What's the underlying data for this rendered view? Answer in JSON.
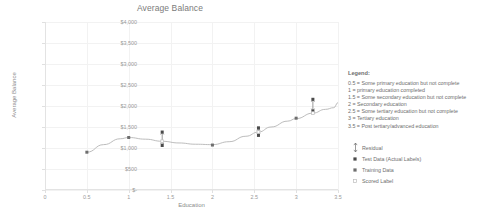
{
  "chart_data": {
    "type": "scatter",
    "title": "Average Balance",
    "xlabel": "Education",
    "ylabel": "Average Balance",
    "xlim": [
      0,
      3.5
    ],
    "ylim": [
      0,
      4000
    ],
    "grid": true,
    "legend_position": "right",
    "x_ticks": [
      "0",
      "0.5",
      "1",
      "1.5",
      "2",
      "2.5",
      "3",
      "3.5"
    ],
    "x_tick_values": [
      0,
      0.5,
      1,
      1.5,
      2,
      2.5,
      3,
      3.5
    ],
    "y_ticks": [
      "$-",
      "$500",
      "$1,000",
      "$1,500",
      "$2,000",
      "$2,500",
      "$3,000",
      "$3,500",
      "$4,000"
    ],
    "y_tick_values": [
      0,
      500,
      1000,
      1500,
      2000,
      2500,
      3000,
      3500,
      4000
    ],
    "series": [
      {
        "name": "Scored Label",
        "type": "line",
        "x": [
          0.5,
          0.7,
          0.9,
          1.0,
          1.2,
          1.4,
          1.6,
          1.8,
          2.0,
          2.2,
          2.4,
          2.55,
          2.7,
          2.9,
          3.0,
          3.2,
          3.35,
          3.45,
          3.5
        ],
        "values": [
          900,
          1080,
          1220,
          1250,
          1210,
          1160,
          1120,
          1090,
          1080,
          1150,
          1280,
          1380,
          1500,
          1640,
          1700,
          1830,
          1920,
          1960,
          2080
        ]
      },
      {
        "name": "Training Data",
        "type": "scatter",
        "x": [
          0.5,
          1.0,
          2.0,
          3.0
        ],
        "values": [
          900,
          1250,
          1070,
          1710
        ]
      },
      {
        "name": "Test Data (Actual Labels)",
        "type": "scatter",
        "x": [
          1.4,
          1.4,
          2.55,
          2.55,
          3.2,
          3.2
        ],
        "values": [
          1380,
          1060,
          1480,
          1300,
          2160,
          1880
        ]
      },
      {
        "name": "Residual",
        "type": "errorbar",
        "x": [
          1.4,
          2.55,
          3.2
        ],
        "y_low": [
          1060,
          1300,
          1880
        ],
        "y_high": [
          1380,
          1480,
          2160
        ]
      }
    ],
    "annotations": []
  },
  "legend": {
    "heading": "Legend:",
    "education_codes": [
      "0.5 = Some primary education but not complete",
      "1 = primary education completed",
      "1.5 = Some secondary education but not complete",
      "2 = Secondary education",
      "2.5 = Some tertiary education but not complete",
      "3 = Tertiary education",
      "3.5 = Post tertiary/advanced education"
    ],
    "keys": [
      {
        "label": "Residual",
        "symbol": "residual-arrow-icon"
      },
      {
        "label": "Test Data (Actual Labels)",
        "symbol": "square-marker-dark-icon"
      },
      {
        "label": "Training Data",
        "symbol": "square-marker-mid-icon"
      },
      {
        "label": "Scored Label",
        "symbol": "square-marker-light-icon"
      }
    ]
  },
  "colors": {
    "text": "#6e6e6e",
    "axis": "#9a9a9a",
    "grid": "#f2f2f2",
    "line": "#b4b4b4",
    "marker_dark": "#4a4a4a",
    "marker_mid": "#6e6e6e",
    "marker_light": "#bdbdbd"
  }
}
